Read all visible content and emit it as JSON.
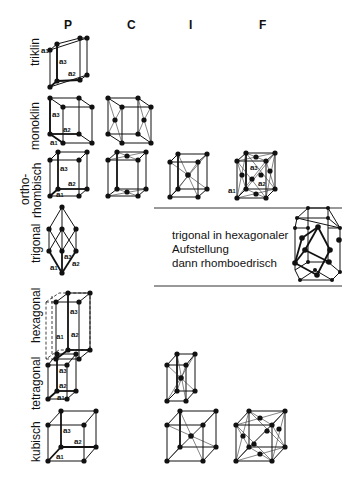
{
  "columns": [
    {
      "id": "P",
      "label": "P"
    },
    {
      "id": "C",
      "label": "C"
    },
    {
      "id": "I",
      "label": "I"
    },
    {
      "id": "F",
      "label": "F"
    }
  ],
  "rows": [
    {
      "id": "triklin",
      "label": "triklin",
      "cells": [
        "P"
      ]
    },
    {
      "id": "monoklin",
      "label": "monoklin",
      "cells": [
        "P",
        "C"
      ]
    },
    {
      "id": "orthorhombisch",
      "label_line1": "ortho-",
      "label_line2": "rhombisch",
      "cells": [
        "P",
        "C",
        "I",
        "F"
      ]
    },
    {
      "id": "trigonal",
      "label": "trigonal",
      "cells": [
        "P"
      ]
    },
    {
      "id": "hexagonal",
      "label": "hexagonal",
      "cells": [
        "P"
      ]
    },
    {
      "id": "tetragonal",
      "label": "tetragonal",
      "cells": [
        "P",
        "I"
      ]
    },
    {
      "id": "kubisch",
      "label": "kubisch",
      "cells": [
        "P",
        "I",
        "F"
      ]
    }
  ],
  "axis_labels": {
    "a1": "a",
    "a2": "a",
    "a3": "a",
    "sub1": "1",
    "sub2": "2",
    "sub3": "3"
  },
  "note": {
    "line1": "trigonal in hexagonaler",
    "line2": "Aufstellung",
    "line3": "dann rhomboedrisch"
  }
}
